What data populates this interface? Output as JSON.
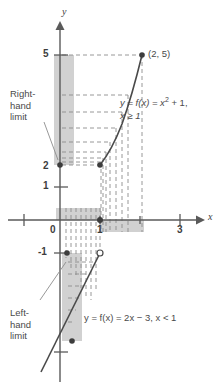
{
  "figure": {
    "axes": {
      "x_label": "x",
      "y_label": "y",
      "x_ticks": [
        {
          "value": 0,
          "label": "0",
          "px": 60
        },
        {
          "value": 1,
          "label": "1",
          "px": 100
        },
        {
          "value": 3,
          "label": "3",
          "px": 180
        }
      ],
      "x_ticks_unlabeled": [
        -1,
        2
      ],
      "y_ticks": [
        {
          "value": 5,
          "label": "5",
          "py": 55
        },
        {
          "value": 1,
          "label": "1",
          "py": 187
        },
        {
          "value": -1,
          "label": "-1",
          "py": 253
        }
      ],
      "y_ticks_unlabeled": [
        2,
        3,
        4,
        -4
      ],
      "x_range": [
        -1.6,
        3.9
      ],
      "y_range": [
        -4.7,
        6.0
      ],
      "origin_px": [
        60,
        220
      ]
    },
    "curves": [
      {
        "name": "parabola-branch",
        "equation": "y = f(x) = x² + 1,  x ≥ 1",
        "domain": "x >= 1",
        "points": [
          [
            1,
            2
          ],
          [
            1.25,
            2.5625
          ],
          [
            1.5,
            3.25
          ],
          [
            1.75,
            4.0625
          ],
          [
            2,
            5
          ]
        ],
        "endpoint_closed": [
          1,
          2
        ],
        "endpoint_marked": [
          2,
          5
        ]
      },
      {
        "name": "line-branch",
        "equation": "y = f(x) = 2x − 3,   x < 1",
        "domain": "x < 1",
        "points": [
          [
            -0.6,
            -4.2
          ],
          [
            0,
            -3
          ],
          [
            1,
            -1
          ]
        ],
        "endpoint_open": [
          1,
          -1
        ],
        "endpoint_closed": [
          0,
          -3
        ]
      }
    ],
    "labels": {
      "right_hand_limit": "Right-\nhand\nlimit",
      "left_hand_limit": "Left-\nhand\nlimit",
      "point_2_5": "(2, 5)",
      "eq_parabola_line1": "y = f(x) = x",
      "eq_parabola_exp": "2",
      "eq_parabola_line1b": " + 1,",
      "eq_parabola_line2": "x ≥ 1",
      "eq_line": "y = f(x) = 2x − 3,   x < 1"
    },
    "shading": {
      "right_limit_bar": {
        "x_from": 1.95,
        "x_to": 2.45,
        "y_from": 2,
        "y_to": 5
      },
      "left_limit_bar": {
        "x_from": 0.05,
        "x_to": 0.55,
        "y_from": -3,
        "y_to": -1
      },
      "x_bar_left": {
        "x_from": -0.1,
        "x_to": 1.0,
        "y_from": 0.0,
        "y_to": 0.42
      },
      "x_bar_right": {
        "x_from": 1.0,
        "x_to": 2.05,
        "y_from": -0.42,
        "y_to": 0.0
      }
    },
    "colors": {
      "axis": "#5a5a5a",
      "curve": "#4a4a4a",
      "dashed": "#8c8c8c",
      "shade": "#c9c9c9",
      "text": "#4a4a4a",
      "background": "#ffffff"
    }
  }
}
